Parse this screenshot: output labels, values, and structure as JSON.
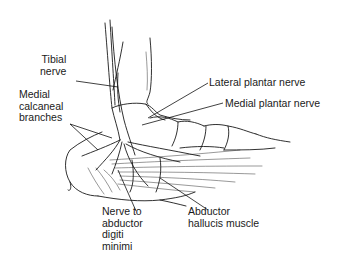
{
  "figure": {
    "labels": {
      "tibial_nerve": "Tibial\nnerve",
      "medial_calcaneal_branches": "Medial\ncalcaneal\nbranches",
      "lateral_plantar_nerve": "Lateral plantar nerve",
      "medial_plantar_nerve": "Medial plantar nerve",
      "nerve_to_abductor_digiti_minimi": "Nerve to\nabductor\ndigiti\nminimi",
      "abductor_hallucis_muscle": "Abductor\nhallucis muscle"
    }
  }
}
